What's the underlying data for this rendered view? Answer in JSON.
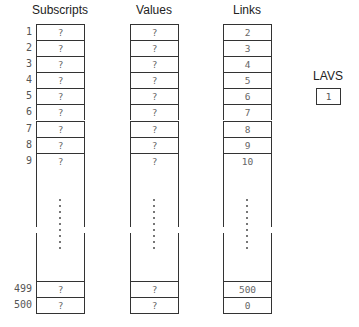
{
  "columns": [
    {
      "title": "Subscripts",
      "top_values": [
        "?",
        "?",
        "?",
        "?",
        "?",
        "?",
        "?",
        "?",
        "?"
      ],
      "bottom_values": [
        "?",
        "?"
      ]
    },
    {
      "title": "Values",
      "top_values": [
        "?",
        "?",
        "?",
        "?",
        "?",
        "?",
        "?",
        "?",
        "?"
      ],
      "bottom_values": [
        "?",
        "?"
      ]
    },
    {
      "title": "Links",
      "top_values": [
        "2",
        "3",
        "4",
        "5",
        "6",
        "7",
        "8",
        "9",
        "10"
      ],
      "bottom_values": [
        "500",
        "0"
      ]
    }
  ],
  "row_labels": {
    "top": [
      "1",
      "2",
      "3",
      "4",
      "5",
      "6",
      "7",
      "8",
      "9"
    ],
    "bottom": [
      "499",
      "500"
    ]
  },
  "lavs": {
    "title": "LAVS",
    "value": "1"
  }
}
